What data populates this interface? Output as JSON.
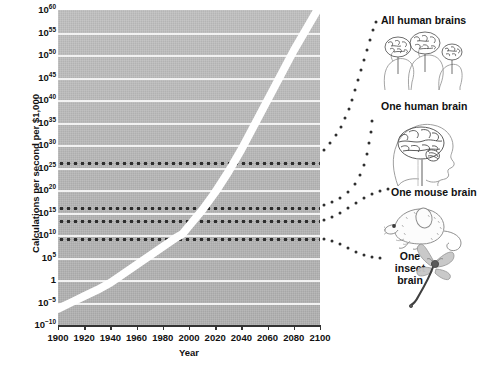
{
  "chart_data": {
    "type": "line",
    "title": "",
    "xlabel": "Year",
    "ylabel": "Calculations per second per $1,000",
    "xlim": [
      1900,
      2100
    ],
    "ylim_log10": [
      -10,
      60
    ],
    "grid": true,
    "legend_position": "right-annotations",
    "x_ticks": [
      "1900",
      "1920",
      "1940",
      "1960",
      "1980",
      "2000",
      "2020",
      "2040",
      "2060",
      "2080",
      "2100"
    ],
    "x_tick_values": [
      1900,
      1920,
      1940,
      1960,
      1980,
      2000,
      2020,
      2040,
      2060,
      2080,
      2100
    ],
    "y_ticks": [
      {
        "label": "10",
        "exp": "60",
        "log10": 60
      },
      {
        "label": "10",
        "exp": "55",
        "log10": 55
      },
      {
        "label": "10",
        "exp": "50",
        "log10": 50
      },
      {
        "label": "10",
        "exp": "45",
        "log10": 45
      },
      {
        "label": "10",
        "exp": "40",
        "log10": 40
      },
      {
        "label": "10",
        "exp": "35",
        "log10": 35
      },
      {
        "label": "10",
        "exp": "30",
        "log10": 30
      },
      {
        "label": "10",
        "exp": "25",
        "log10": 25
      },
      {
        "label": "10",
        "exp": "20",
        "log10": 20
      },
      {
        "label": "10",
        "exp": "15",
        "log10": 15
      },
      {
        "label": "10",
        "exp": "10",
        "log10": 10
      },
      {
        "label": "10",
        "exp": "5",
        "log10": 5
      },
      {
        "label": "1",
        "exp": "",
        "log10": 0
      },
      {
        "label": "10",
        "exp": "−5",
        "log10": -5
      },
      {
        "label": "10",
        "exp": "−10",
        "log10": -10
      }
    ],
    "series": [
      {
        "name": "Calculations per second per $1,000",
        "style": "thick white band",
        "x": [
          1900,
          1910,
          1920,
          1930,
          1940,
          1950,
          1960,
          1970,
          1980,
          1990,
          1995,
          2000,
          2010,
          2020,
          2030,
          2040,
          2050,
          2060,
          2070,
          2080,
          2090,
          2100
        ],
        "y_log10": [
          -6.4,
          -5.0,
          -3.6,
          -2.2,
          -0.6,
          1.4,
          3.4,
          5.4,
          7.4,
          9.4,
          10.2,
          12.0,
          15.5,
          19.5,
          24.0,
          29.0,
          34.5,
          40.0,
          45.5,
          51.0,
          56.0,
          61.0
        ]
      }
    ],
    "reference_lines": [
      {
        "label": "All human brains",
        "y_log10": 26.0,
        "style": "dotted"
      },
      {
        "label": "One human brain",
        "y_log10": 16.0,
        "style": "dotted"
      },
      {
        "label": "One mouse brain",
        "y_log10": 13.0,
        "style": "dotted"
      },
      {
        "label": "One insect brain",
        "y_log10": 9.0,
        "style": "dotted"
      }
    ]
  },
  "annotations": [
    {
      "id": "all-human-brains",
      "label": "All human brains",
      "art": "three-human-head-brain-profiles"
    },
    {
      "id": "one-human-brain",
      "label": "One human brain",
      "art": "human-head-brain-profile"
    },
    {
      "id": "one-mouse-brain",
      "label": "One mouse brain",
      "art": "mouse-illustration"
    },
    {
      "id": "one-insect-brain",
      "label": "One insect brain",
      "art": "dragonfly-illustration"
    }
  ],
  "colors": {
    "plot_background": "#b9b9b9",
    "gridline": "#f2f2f2",
    "curve": "#ffffff",
    "dotted_line": "#2e2e2e",
    "text": "#111111",
    "page_background": "#ffffff"
  }
}
